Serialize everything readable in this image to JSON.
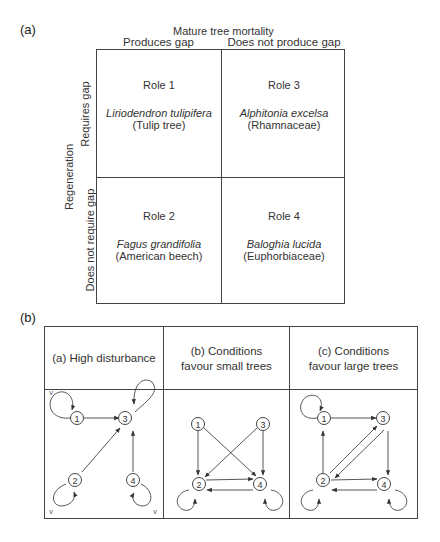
{
  "panel_a": {
    "label": "(a)",
    "column_axis_title": "Mature tree mortality",
    "columns": [
      "Produces gap",
      "Does not produce gap"
    ],
    "row_axis_title": "Regeneration",
    "rows": [
      "Requires gap",
      "Does not require gap"
    ],
    "cells": [
      {
        "role": "Role 1",
        "species": "Liriodendron tulipifera",
        "common": "(Tulip tree)"
      },
      {
        "role": "Role 3",
        "species": "Alphitonia excelsa",
        "common": "(Rhamnaceae)"
      },
      {
        "role": "Role 2",
        "species": "Fagus grandifolia",
        "common": "(American beech)"
      },
      {
        "role": "Role 4",
        "species": "Baloghia lucida",
        "common": "(Euphorbiaceae)"
      }
    ]
  },
  "panel_b": {
    "label": "(b)",
    "columns": [
      {
        "title": "(a) High disturbance"
      },
      {
        "title": "(b) Conditions favour small trees"
      },
      {
        "title": "(c) Conditions favour large trees"
      }
    ],
    "node_labels": [
      "1",
      "2",
      "3",
      "4"
    ],
    "self_loop_marker": "V",
    "graphs": [
      {
        "name": "high-disturbance",
        "self_loops": [
          "1",
          "2",
          "3",
          "4"
        ],
        "edges": [
          [
            "1",
            "3"
          ],
          [
            "2",
            "3"
          ],
          [
            "4",
            "3"
          ]
        ]
      },
      {
        "name": "favour-small-trees",
        "self_loops": [
          "2",
          "4"
        ],
        "edges": [
          [
            "1",
            "2"
          ],
          [
            "1",
            "4"
          ],
          [
            "3",
            "2"
          ],
          [
            "3",
            "4"
          ],
          [
            "2",
            "4"
          ],
          [
            "4",
            "2"
          ]
        ]
      },
      {
        "name": "favour-large-trees",
        "self_loops": [
          "1",
          "2",
          "4"
        ],
        "edges": [
          [
            "1",
            "3"
          ],
          [
            "2",
            "1"
          ],
          [
            "2",
            "3"
          ],
          [
            "3",
            "2"
          ],
          [
            "3",
            "4"
          ],
          [
            "2",
            "4"
          ],
          [
            "4",
            "2"
          ]
        ]
      }
    ]
  },
  "colors": {
    "line": "#444444",
    "text": "#333333",
    "background": "#ffffff"
  }
}
